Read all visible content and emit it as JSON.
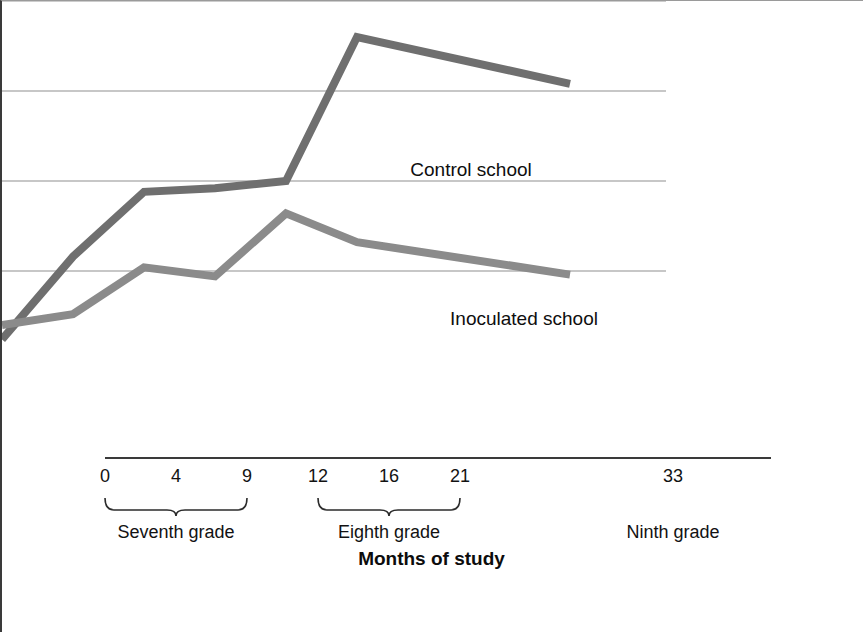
{
  "figure": {
    "panel_color": "#c6c6c6",
    "plot_bg": "#ffffff"
  },
  "chart_data": {
    "type": "line",
    "title": "",
    "ylabel": "Percent smoking",
    "xlabel": "Months of study",
    "x": [
      0,
      4,
      9,
      12,
      16,
      21,
      33
    ],
    "xtick_labels": [
      "0",
      "4",
      "9",
      "12",
      "16",
      "21",
      "33"
    ],
    "ytick_labels": [
      "0",
      "5",
      "10",
      "15",
      "20"
    ],
    "yticks": [
      0,
      5,
      10,
      15,
      20
    ],
    "ylim": [
      0,
      20
    ],
    "xlim": [
      0,
      33
    ],
    "grid": "horizontal",
    "legend_position": "inline-annotations",
    "series": [
      {
        "name": "Control school",
        "color": "#6f6f6f",
        "values": [
          1.2,
          5.8,
          9.4,
          9.6,
          10.0,
          18.0,
          15.4
        ],
        "label_x": 17.5,
        "label_y": 15.9
      },
      {
        "name": "Inoculated school",
        "color": "#8b8b8b",
        "values": [
          2.0,
          2.6,
          5.2,
          4.7,
          8.2,
          6.6,
          4.8
        ],
        "label_x": 20.3,
        "label_y": 7.6
      }
    ],
    "groups": [
      {
        "label": "Seventh grade",
        "from": 0,
        "to": 9,
        "bracket": true
      },
      {
        "label": "Eighth grade",
        "from": 12,
        "to": 21,
        "bracket": true
      },
      {
        "label": "Ninth grade",
        "from": 33,
        "to": 33,
        "bracket": false
      }
    ]
  }
}
